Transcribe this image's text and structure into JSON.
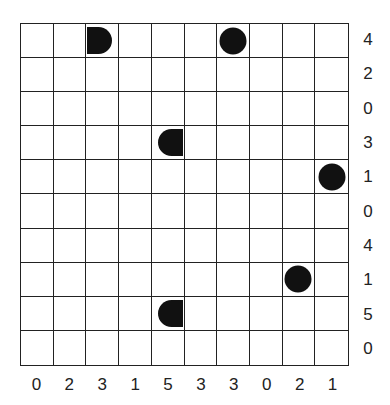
{
  "puzzle": {
    "type": "battleships",
    "rows": 10,
    "cols": 10,
    "row_clues": [
      "4",
      "2",
      "0",
      "3",
      "1",
      "0",
      "4",
      "1",
      "5",
      "0"
    ],
    "col_clues": [
      "0",
      "2",
      "3",
      "1",
      "5",
      "3",
      "3",
      "0",
      "2",
      "1"
    ],
    "pieces": [
      {
        "row": 0,
        "col": 2,
        "shape": "end-right",
        "icon": "ship-end-right-icon"
      },
      {
        "row": 0,
        "col": 6,
        "shape": "circle",
        "icon": "ship-submarine-icon"
      },
      {
        "row": 3,
        "col": 4,
        "shape": "end-left",
        "icon": "ship-end-left-icon"
      },
      {
        "row": 4,
        "col": 9,
        "shape": "circle",
        "icon": "ship-submarine-icon"
      },
      {
        "row": 7,
        "col": 8,
        "shape": "circle",
        "icon": "ship-submarine-icon"
      },
      {
        "row": 8,
        "col": 4,
        "shape": "end-left",
        "icon": "ship-end-left-icon"
      }
    ],
    "colors": {
      "grid_line": "#222222",
      "piece": "#111111",
      "background": "#ffffff"
    }
  }
}
